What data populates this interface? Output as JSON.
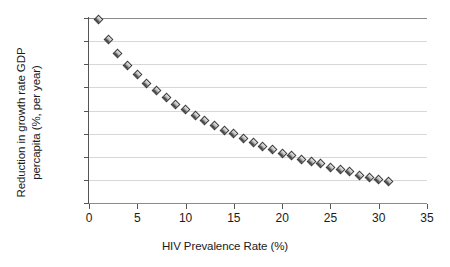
{
  "chart_data": {
    "type": "scatter",
    "title": "",
    "xlabel": "HIV Prevalence Rate (%)",
    "ylabel": "Reduction in growth rate GDP percapita (%, per year)",
    "ylabel_lines": [
      "Reduction in growth rate GDP",
      "percapita (%, per year)"
    ],
    "xlim": [
      0,
      35
    ],
    "ylim": [
      -1.6,
      0
    ],
    "xticks": [
      0,
      5,
      10,
      15,
      20,
      25,
      30,
      35
    ],
    "xticklabels": [
      "0",
      "5",
      "10",
      "15",
      "20",
      "25",
      "30",
      "35"
    ],
    "yticks": [
      0,
      -0.2,
      -0.4,
      -0.6,
      -0.8,
      -1,
      -1.2,
      -1.4,
      -1.6
    ],
    "yticklabels": [
      "0",
      "-0.2",
      "-0.4",
      "-0.6",
      "-0.8",
      "-1",
      "-1.2",
      "-1.4",
      "-1.6"
    ],
    "grid": "horizontal",
    "legend": "none",
    "marker": "diamond",
    "marker_color": "#9a9a9a",
    "x": [
      1,
      2,
      3,
      4,
      5,
      6,
      7,
      8,
      9,
      10,
      11,
      12,
      13,
      14,
      15,
      16,
      17,
      18,
      19,
      20,
      21,
      22,
      23,
      24,
      25,
      26,
      27,
      28,
      29,
      30,
      31
    ],
    "y": [
      -0.01,
      -0.19,
      -0.31,
      -0.41,
      -0.49,
      -0.57,
      -0.63,
      -0.69,
      -0.75,
      -0.79,
      -0.84,
      -0.89,
      -0.93,
      -0.97,
      -1.0,
      -1.04,
      -1.08,
      -1.11,
      -1.14,
      -1.17,
      -1.19,
      -1.22,
      -1.24,
      -1.26,
      -1.29,
      -1.31,
      -1.33,
      -1.36,
      -1.38,
      -1.4,
      -1.41
    ],
    "series_name": ""
  },
  "axis": {
    "x_title": "HIV Prevalence Rate (%)"
  },
  "colors": {
    "gridline": "#d8d8d8",
    "axis": "#555555",
    "background": "#ffffff",
    "marker_dark": "#1b1b1b",
    "marker_light": "#e9e9e9"
  }
}
